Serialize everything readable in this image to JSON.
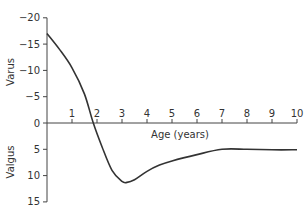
{
  "chart_data": {
    "type": "line",
    "title": "",
    "xlabel": "Age (years)",
    "ylabel_top": "Varus",
    "ylabel_bottom": "Valgus",
    "xlim": [
      0,
      10
    ],
    "ylim": [
      -20,
      15
    ],
    "y_inverted": true,
    "grid": false,
    "x_ticks": [
      1,
      2,
      3,
      4,
      5,
      6,
      7,
      8,
      9,
      10
    ],
    "x_tick_labels": [
      "1",
      "2",
      "3",
      "4",
      "5",
      "6",
      "7",
      "8",
      "9",
      "10"
    ],
    "y_ticks": [
      -20,
      -15,
      -10,
      -5,
      0,
      5,
      10,
      15
    ],
    "y_tick_labels": [
      "-20",
      "-15",
      "-10",
      "-5",
      "0",
      "5",
      "10",
      "15"
    ],
    "series": [
      {
        "name": "Tibiofemoral angle",
        "color": "#333333",
        "x": [
          0,
          0.5,
          1,
          1.5,
          1.85,
          2.2,
          2.6,
          3.0,
          3.2,
          3.5,
          4.0,
          4.5,
          5.0,
          6.0,
          7.0,
          8.0,
          9.0,
          10.0
        ],
        "y": [
          -17,
          -14,
          -10.5,
          -5.5,
          0,
          4.5,
          9,
          11.1,
          11.3,
          10.8,
          9.2,
          8,
          7.2,
          6,
          5,
          5,
          5.1,
          5.1
        ]
      }
    ]
  },
  "layout": {
    "origin_px": [
      47,
      123
    ],
    "px_per_year": 25,
    "px_per_degree": 5.26
  }
}
